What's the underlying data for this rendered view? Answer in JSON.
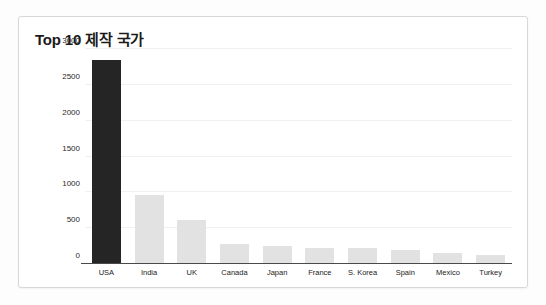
{
  "chart_data": {
    "type": "bar",
    "title": "Top 10 제작 국가",
    "xlabel": "",
    "ylabel": "",
    "ylim": [
      0,
      3000
    ],
    "yticks": [
      0,
      500,
      1000,
      1500,
      2000,
      2500,
      3000
    ],
    "ytick_labels": [
      "0",
      "500",
      "1000",
      "1500",
      "2000",
      "2500",
      "3000"
    ],
    "grid": true,
    "legend": "none",
    "categories": [
      "USA",
      "India",
      "UK",
      "Canada",
      "Japan",
      "France",
      "S. Korea",
      "Spain",
      "Mexico",
      "Turkey"
    ],
    "values": [
      2850,
      950,
      600,
      260,
      245,
      215,
      205,
      185,
      140,
      115
    ],
    "highlight_index": 0,
    "colors": {
      "bar_default": "#e2e2e2",
      "bar_highlight": "#252525",
      "axis": "#4a4a4a",
      "gridline": "#f1f1f1",
      "title_text": "#1b1b1b",
      "tick_text": "#222222",
      "card_background": "#ffffff",
      "card_border": "#d8d8d8",
      "page_background": "#fdfdfd"
    }
  }
}
